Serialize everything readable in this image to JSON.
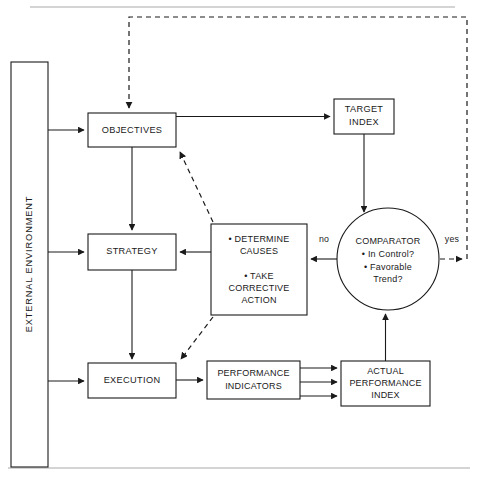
{
  "figure": {
    "title": "",
    "type": "flowchart",
    "canvas": {
      "width": 480,
      "height": 477
    },
    "colors": {
      "stroke": "#1a1a1a",
      "fill": "#ffffff",
      "rule": "#aaaaaa"
    }
  },
  "nodes": {
    "external_environment": {
      "label": "EXTERNAL ENVIRONMENT",
      "shape": "rectangle",
      "orientation": "vertical"
    },
    "objectives": {
      "label": "OBJECTIVES",
      "shape": "rectangle"
    },
    "strategy": {
      "label": "STRATEGY",
      "shape": "rectangle"
    },
    "execution": {
      "label": "EXECUTION",
      "shape": "rectangle"
    },
    "target_index": {
      "line1": "TARGET",
      "line2": "INDEX",
      "shape": "rectangle"
    },
    "comparator": {
      "title": "COMPARATOR",
      "bullet1": "• In Control?",
      "bullet2": "• Favorable",
      "bullet3": "Trend?",
      "shape": "circle"
    },
    "corrective": {
      "line1": "• DETERMINE",
      "line2": "CAUSES",
      "line3": "• TAKE",
      "line4": "CORRECTIVE",
      "line5": "ACTION",
      "shape": "rectangle"
    },
    "performance_indicators": {
      "line1": "PERFORMANCE",
      "line2": "INDICATORS",
      "shape": "rectangle"
    },
    "actual_performance_index": {
      "line1": "ACTUAL",
      "line2": "PERFORMANCE",
      "line3": "INDEX",
      "shape": "rectangle"
    }
  },
  "edge_labels": {
    "no": "no",
    "yes": "yes"
  }
}
